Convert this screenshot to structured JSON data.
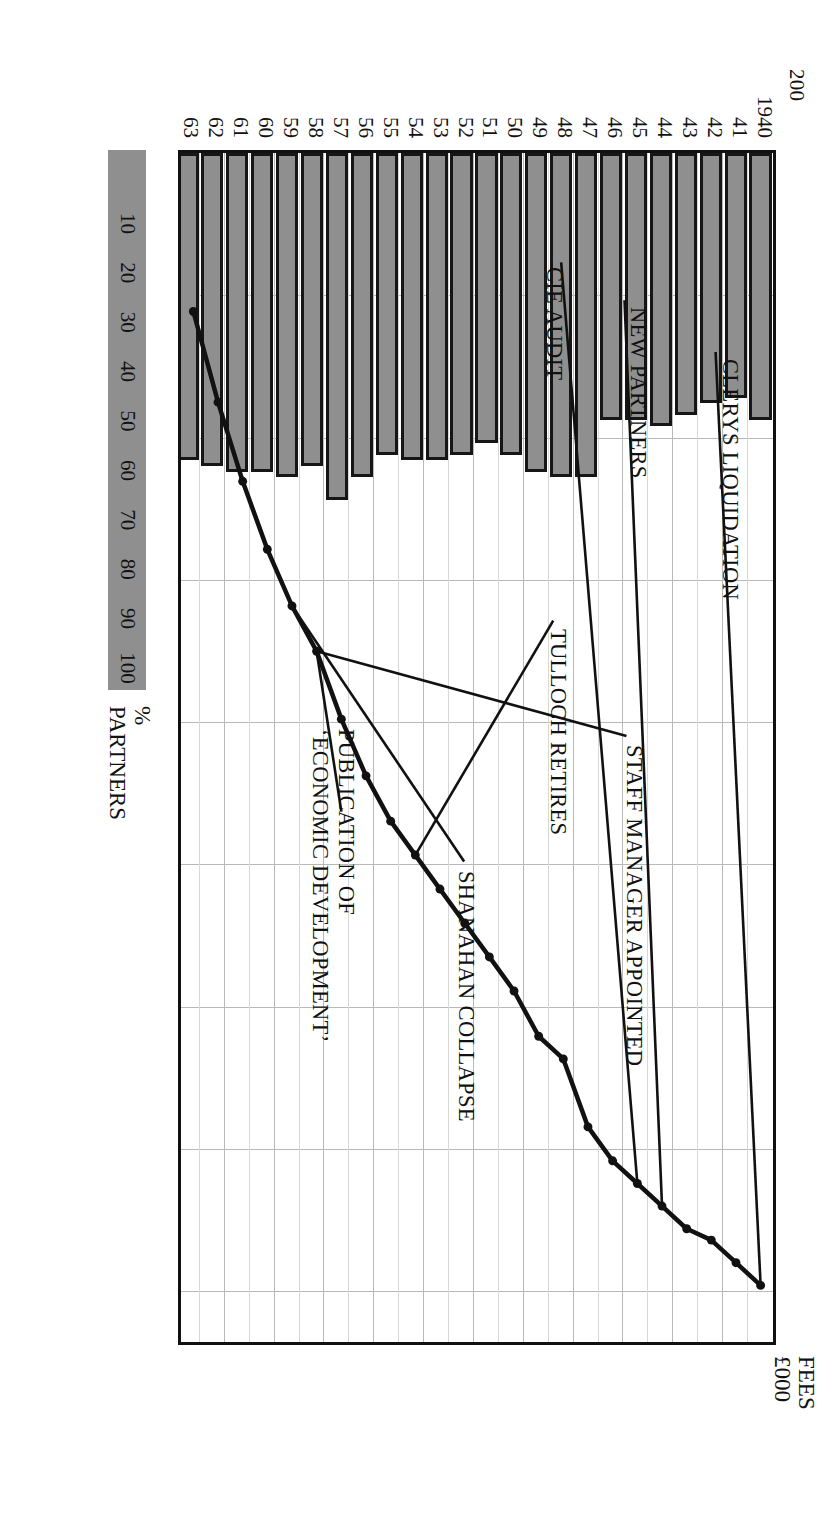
{
  "figure": {
    "fees_axis_title_line1": "FEES",
    "fees_axis_title_line2": "£000",
    "partners_axis_title_line1": "%",
    "partners_axis_title_line2": "PARTNERS"
  },
  "chart_data": {
    "type": "bar",
    "title": "",
    "subtitle": "",
    "xlabel": "",
    "ylabel": "FEES £000",
    "y2label": "PARTNERS %",
    "ylim": [
      0,
      210
    ],
    "y2lim": [
      0,
      105
    ],
    "grid": true,
    "legend_position": "bottom-left",
    "orientation": "horizontal-bars-rotated-page",
    "categories": [
      "1940",
      "41",
      "42",
      "43",
      "44",
      "45",
      "46",
      "47",
      "48",
      "49",
      "50",
      "51",
      "52",
      "53",
      "54",
      "55",
      "56",
      "57",
      "58",
      "59",
      "60",
      "61",
      "62",
      "63"
    ],
    "yticks": [
      25,
      50,
      75,
      100,
      125,
      150,
      175,
      200
    ],
    "y2ticks": [
      10,
      20,
      30,
      40,
      50,
      60,
      70,
      80,
      90,
      100
    ],
    "series": [
      {
        "name": "Fees £000",
        "type": "bar",
        "axis": "primary",
        "values": [
          47,
          43,
          44,
          46,
          48,
          47,
          47,
          57,
          57,
          56,
          53,
          51,
          53,
          54,
          54,
          53,
          57,
          61,
          55,
          57,
          56,
          56,
          55,
          54
        ]
      },
      {
        "name": "Partners %",
        "type": "line",
        "axis": "secondary",
        "values": [
          100,
          98,
          96,
          95,
          93,
          91,
          89,
          86,
          80,
          78,
          74,
          71,
          68,
          65,
          62,
          59,
          55,
          50,
          44,
          40,
          35,
          29,
          22,
          14
        ]
      }
    ],
    "annotations": [
      {
        "id": "clerys-liquidation",
        "text": "CLERYS LIQUIDATION",
        "points_to_year": "1940"
      },
      {
        "id": "new-partners",
        "text": "NEW PARTNERS",
        "points_to_year": "44"
      },
      {
        "id": "cie-audit",
        "text": "CIE AUDIT",
        "points_to_year": "45"
      },
      {
        "id": "tulloch-retires",
        "text": "TULLOCH RETIRES",
        "points_to_year": "54"
      },
      {
        "id": "staff-manager-appointed",
        "text": "STAFF MANAGER APPOINTED",
        "points_to_year": "58"
      },
      {
        "id": "shanahan-collapse",
        "text": "SHANAHAN COLLAPSE",
        "points_to_year": "59"
      },
      {
        "id": "publication-economic-development",
        "text": "PUBLICATION OF\n‘ECONOMIC DEVELOPMENT’",
        "points_to_year": "58"
      }
    ]
  },
  "axis": {
    "fees_ticks": [
      "25",
      "50",
      "75",
      "100",
      "125",
      "150",
      "175",
      "200"
    ],
    "year_ticks": [
      "1940",
      "41",
      "42",
      "43",
      "44",
      "45",
      "46",
      "47",
      "48",
      "49",
      "50",
      "51",
      "52",
      "53",
      "54",
      "55",
      "56",
      "57",
      "58",
      "59",
      "60",
      "61",
      "62",
      "63"
    ],
    "partners_ticks": [
      "10",
      "20",
      "30",
      "40",
      "50",
      "60",
      "70",
      "80",
      "90",
      "100"
    ]
  },
  "annotations": {
    "clerys": "CLERYS LIQUIDATION",
    "new_partners": "NEW PARTNERS",
    "cie_audit": "CIE AUDIT",
    "tulloch": "TULLOCH RETIRES",
    "staff_manager": "STAFF MANAGER APPOINTED",
    "shanahan": "SHANAHAN COLLAPSE",
    "publication_l1": "PUBLICATION OF",
    "publication_l2": "‘ECONOMIC DEVELOPMENT’"
  },
  "colors": {
    "bar_fill": "#8f8f8f",
    "bar_stroke": "#161616",
    "line": "#111111",
    "grid": "#b9b9b9",
    "background": "#ffffff"
  }
}
